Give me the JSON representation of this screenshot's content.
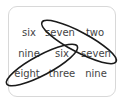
{
  "puzzle": {
    "grid": [
      [
        "six",
        "seven",
        "two"
      ],
      [
        "nine",
        "six",
        "seven"
      ],
      [
        "eight",
        "three",
        "nine"
      ]
    ],
    "circled": [
      {
        "from": "seven",
        "to": "seven",
        "cells": [
          [
            0,
            1
          ],
          [
            1,
            2
          ]
        ]
      },
      {
        "from": "six",
        "to": "eight",
        "cells": [
          [
            1,
            1
          ],
          [
            2,
            0
          ]
        ]
      }
    ],
    "colors": {
      "text": "#444444",
      "ellipse": "#1a1a1a",
      "border": "#d8d8d8",
      "background": "#ffffff"
    }
  }
}
